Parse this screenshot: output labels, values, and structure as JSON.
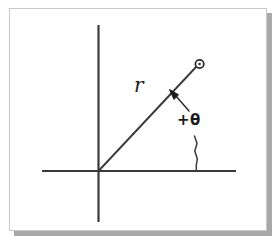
{
  "figure": {
    "title_visible": false,
    "background_color": "#ffffff",
    "panel": {
      "name": "diagram-panel",
      "fill": "#ffffff",
      "border_color": "#c9c9c9",
      "shadow_color": "#a8a8a8"
    },
    "stroke_color": "#333333",
    "labels": {
      "radius": "r",
      "angle": "+θ"
    },
    "elements": {
      "y_axis": "vertical-axis",
      "x_axis": "horizontal-axis",
      "ray": "radius-ray",
      "point_marker": "point-marker-circle",
      "r_leader": "r-leader-arrow",
      "theta_leader": "theta-leader-line"
    },
    "geometry": {
      "origin": [
        98,
        171
      ],
      "x_axis_span": [
        42,
        236
      ],
      "y_axis_span": [
        25,
        222
      ],
      "ray_end": [
        197,
        66
      ],
      "marker_center": [
        199.5,
        64
      ],
      "marker_radius": 4.5
    }
  }
}
